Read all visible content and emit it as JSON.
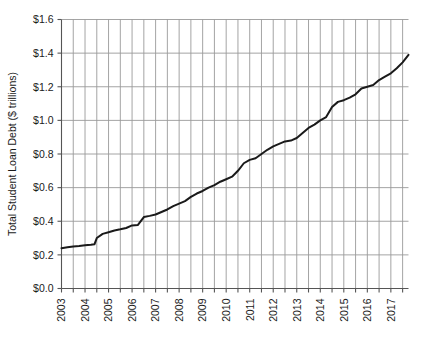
{
  "chart_data": {
    "type": "line",
    "title": "",
    "xlabel": "",
    "ylabel": "Total Student Loan Debt ($ trillions)",
    "ylim": [
      0.0,
      1.6
    ],
    "xlim": [
      2003.0,
      2017.75
    ],
    "grid": true,
    "grid_x": "semiannual",
    "grid_y": "major",
    "legend": "none",
    "y_ticks": [
      0.0,
      0.2,
      0.4,
      0.6,
      0.8,
      1.0,
      1.2,
      1.4,
      1.6
    ],
    "y_tick_labels": [
      "$0.0",
      "$0.2",
      "$0.4",
      "$0.6",
      "$0.8",
      "$1.0",
      "$1.2",
      "$1.4",
      "$1.6"
    ],
    "x_ticks": [
      2003,
      2004,
      2005,
      2006,
      2007,
      2008,
      2009,
      2010,
      2011,
      2012,
      2013,
      2014,
      2015,
      2016,
      2017
    ],
    "x_tick_labels": [
      "2003",
      "2004",
      "2005",
      "2006",
      "2007",
      "2008",
      "2009",
      "2010",
      "2011",
      "2012",
      "2013",
      "2014",
      "2015",
      "2016",
      "2017"
    ],
    "line_color": "#1a1a1a",
    "line_width": 2.0,
    "grid_color": "#9a9a9a",
    "axis_color": "#555555",
    "background": "#ffffff",
    "series": [
      {
        "name": "Total Student Loan Debt",
        "x": [
          2003.0,
          2003.25,
          2003.5,
          2003.75,
          2004.0,
          2004.25,
          2004.4,
          2004.5,
          2004.75,
          2005.0,
          2005.25,
          2005.5,
          2005.75,
          2006.0,
          2006.25,
          2006.5,
          2006.75,
          2007.0,
          2007.25,
          2007.5,
          2007.75,
          2008.0,
          2008.25,
          2008.5,
          2008.75,
          2009.0,
          2009.25,
          2009.5,
          2009.75,
          2010.0,
          2010.25,
          2010.5,
          2010.75,
          2011.0,
          2011.25,
          2011.5,
          2011.75,
          2012.0,
          2012.25,
          2012.5,
          2012.75,
          2013.0,
          2013.25,
          2013.5,
          2013.75,
          2014.0,
          2014.25,
          2014.5,
          2014.75,
          2015.0,
          2015.25,
          2015.5,
          2015.75,
          2016.0,
          2016.25,
          2016.5,
          2016.75,
          2017.0,
          2017.25,
          2017.5,
          2017.75
        ],
        "y": [
          0.24,
          0.245,
          0.25,
          0.253,
          0.257,
          0.26,
          0.263,
          0.3,
          0.325,
          0.335,
          0.345,
          0.352,
          0.36,
          0.375,
          0.378,
          0.425,
          0.432,
          0.44,
          0.455,
          0.47,
          0.49,
          0.505,
          0.52,
          0.545,
          0.565,
          0.58,
          0.6,
          0.615,
          0.635,
          0.65,
          0.665,
          0.7,
          0.745,
          0.765,
          0.775,
          0.8,
          0.825,
          0.845,
          0.86,
          0.875,
          0.88,
          0.895,
          0.925,
          0.955,
          0.975,
          1.0,
          1.02,
          1.08,
          1.11,
          1.12,
          1.135,
          1.155,
          1.19,
          1.2,
          1.21,
          1.24,
          1.26,
          1.28,
          1.31,
          1.345,
          1.39
        ]
      }
    ]
  }
}
